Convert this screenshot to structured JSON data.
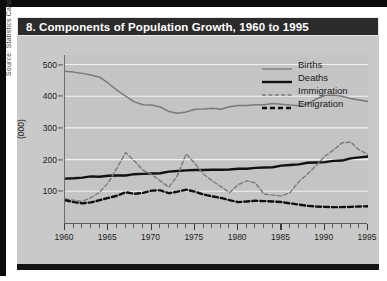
{
  "figure": {
    "title": "8. Components of Population Growth, 1960 to 1995",
    "source": "Source:  Statistics Canada, Demography Division"
  },
  "legend": {
    "items": [
      {
        "label": "Births",
        "style": "thin-solid",
        "color": "#7a7a7a"
      },
      {
        "label": "Deaths",
        "style": "thick-solid",
        "color": "#111111"
      },
      {
        "label": "Immigration",
        "style": "thin-dashed",
        "color": "#7a7a7a"
      },
      {
        "label": "Emigration",
        "style": "thick-dashed",
        "color": "#111111"
      }
    ]
  },
  "colors": {
    "title_bar_bg": "#2b2b2b",
    "title_text": "#ffffff",
    "figure_bg": "#c9c9c9",
    "plot_bg": "#c4c4c4",
    "gridline": "#f2f2f2",
    "axis": "#5a5a5a",
    "births": "#7a7a7a",
    "deaths": "#111111",
    "immigration": "#7a7a7a",
    "emigration": "#111111"
  },
  "chart_data": {
    "type": "line",
    "title": "8. Components of Population Growth, 1960 to 1995",
    "xlabel": "",
    "ylabel": "(000)",
    "xlim": [
      1960,
      1995
    ],
    "ylim": [
      0,
      530
    ],
    "yticks": [
      100,
      200,
      300,
      400,
      500
    ],
    "xticks": [
      1960,
      1965,
      1970,
      1975,
      1980,
      1985,
      1990,
      1995
    ],
    "x_minor_tick_step": 1,
    "grid": "horizontal",
    "legend_position": "top-right",
    "x": [
      1960,
      1961,
      1962,
      1963,
      1964,
      1965,
      1966,
      1967,
      1968,
      1969,
      1970,
      1971,
      1972,
      1973,
      1974,
      1975,
      1976,
      1977,
      1978,
      1979,
      1980,
      1981,
      1982,
      1983,
      1984,
      1985,
      1986,
      1987,
      1988,
      1989,
      1990,
      1991,
      1992,
      1993,
      1994,
      1995
    ],
    "series": [
      {
        "name": "Births",
        "values": [
          479,
          476,
          472,
          467,
          460,
          441,
          419,
          400,
          382,
          373,
          372,
          366,
          352,
          346,
          350,
          359,
          360,
          362,
          359,
          367,
          371,
          371,
          373,
          373,
          377,
          375,
          372,
          370,
          375,
          391,
          402,
          403,
          400,
          393,
          388,
          383
        ]
      },
      {
        "name": "Deaths",
        "values": [
          140,
          141,
          143,
          147,
          146,
          149,
          150,
          150,
          154,
          155,
          156,
          157,
          162,
          164,
          166,
          167,
          167,
          168,
          168,
          169,
          171,
          171,
          174,
          175,
          176,
          181,
          183,
          185,
          190,
          191,
          192,
          196,
          197,
          204,
          207,
          210
        ]
      },
      {
        "name": "Immigration",
        "values": [
          76,
          72,
          68,
          80,
          97,
          127,
          173,
          222,
          196,
          167,
          153,
          133,
          113,
          150,
          218,
          188,
          154,
          133,
          115,
          96,
          121,
          133,
          126,
          91,
          88,
          85,
          96,
          130,
          154,
          181,
          210,
          230,
          253,
          255,
          230,
          217
        ]
      },
      {
        "name": "Emigration",
        "values": [
          72,
          66,
          62,
          65,
          72,
          79,
          86,
          97,
          92,
          95,
          102,
          103,
          94,
          99,
          105,
          99,
          90,
          84,
          79,
          72,
          66,
          68,
          70,
          69,
          68,
          66,
          62,
          58,
          54,
          52,
          51,
          50,
          50,
          51,
          52,
          53
        ]
      }
    ]
  }
}
